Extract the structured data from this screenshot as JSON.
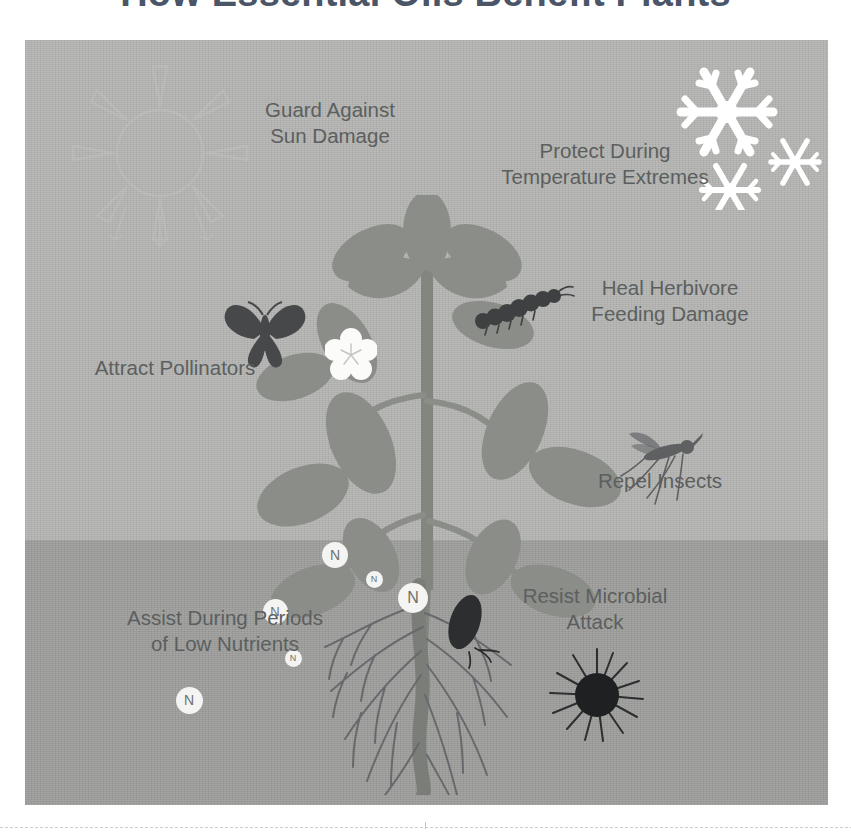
{
  "page": {
    "title": "How Essential Oils Benefit Plants",
    "background_color": "#ffffff"
  },
  "illustration": {
    "sky_color": "#b2b3b0",
    "soil_color": "#9b9c99",
    "plant_color": "#8b8d88",
    "stem_color": "#83857f",
    "root_color": "#6f716c",
    "accent_dark": "#3f4042",
    "snow_color": "#ffffff",
    "text_color": "#5c5f60",
    "soil_line_y": 540
  },
  "labels": {
    "sun_damage": "Guard Against\nSun Damage",
    "temperature": "Protect During\nTemperature Extremes",
    "herbivore": "Heal Herbivore\nFeeding Damage",
    "pollinators": "Attract Pollinators",
    "insects": "Repel Insects",
    "microbial": "Resist Microbial\nAttack",
    "nutrients": "Assist During Periods\nof Low Nutrients"
  },
  "icons": {
    "sun": "sun-icon",
    "snowflakes": "snowflake-icon",
    "butterfly": "butterfly-icon",
    "flower": "flower-icon",
    "caterpillar": "caterpillar-icon",
    "mosquito": "mosquito-icon",
    "grub": "grub-icon",
    "microbe": "microbe-icon",
    "plant": "plant-illustration",
    "roots": "roots-illustration"
  },
  "nutrient_markers": [
    {
      "letter": "N",
      "x": 335,
      "y": 555,
      "size": 26,
      "font_size": 14
    },
    {
      "letter": "N",
      "x": 374,
      "y": 579,
      "size": 17,
      "font_size": 9
    },
    {
      "letter": "N",
      "x": 413,
      "y": 598,
      "size": 30,
      "font_size": 16
    },
    {
      "letter": "N",
      "x": 275,
      "y": 611,
      "size": 25,
      "font_size": 13
    },
    {
      "letter": "N",
      "x": 293,
      "y": 658,
      "size": 17,
      "font_size": 9
    },
    {
      "letter": "N",
      "x": 189,
      "y": 700,
      "size": 27,
      "font_size": 14
    }
  ]
}
